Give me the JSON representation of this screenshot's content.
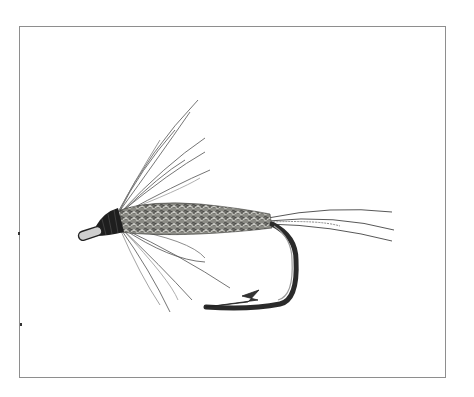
{
  "illustration": {
    "subject": "wet fly (soft hackle) on hook",
    "parts": [
      "hook-eye",
      "head-thread",
      "hackle-upper",
      "hackle-lower",
      "dubbed-body",
      "tail-fibers",
      "hook-bend",
      "hook-point"
    ],
    "colors": {
      "background": "#ffffff",
      "frame": "#8e8e8e",
      "ink_dark": "#222222",
      "ink_mid": "#555555",
      "ink_light": "#9a9a9a",
      "body_mottle": "#6f6f6a"
    }
  },
  "frame": {
    "x": 19,
    "y": 26,
    "width": 427,
    "height": 352
  }
}
